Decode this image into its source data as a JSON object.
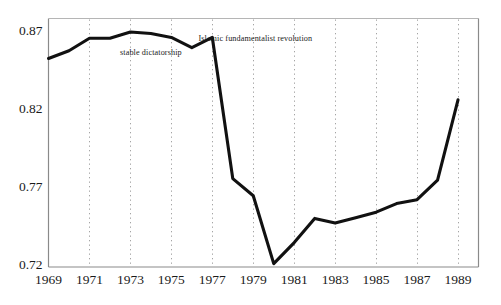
{
  "chart_data": {
    "type": "line",
    "title": "",
    "xlabel": "",
    "ylabel": "",
    "xlim": [
      1969,
      1990
    ],
    "ylim": [
      0.72,
      0.87
    ],
    "grid": "vertical dotted gridlines at odd years",
    "legend": "none",
    "x": [
      1969,
      1970,
      1971,
      1972,
      1973,
      1974,
      1975,
      1976,
      1977,
      1978,
      1979,
      1980,
      1981,
      1982,
      1983,
      1984,
      1985,
      1986,
      1987,
      1988,
      1989
    ],
    "values": [
      0.853,
      0.858,
      0.866,
      0.866,
      0.87,
      0.869,
      0.8665,
      0.86,
      0.8665,
      0.776,
      0.765,
      0.7215,
      0.735,
      0.7505,
      0.7475,
      0.751,
      0.7545,
      0.76,
      0.7625,
      0.775,
      0.8265
    ],
    "series": [
      {
        "name": "index",
        "values": [
          0.853,
          0.858,
          0.866,
          0.866,
          0.87,
          0.869,
          0.8665,
          0.86,
          0.8665,
          0.776,
          0.765,
          0.7215,
          0.735,
          0.7505,
          0.7475,
          0.751,
          0.7545,
          0.76,
          0.7625,
          0.775,
          0.8265
        ]
      }
    ],
    "yticks": [
      0.72,
      0.77,
      0.82,
      0.87
    ],
    "ytick_labels": [
      "0.72",
      "0.77",
      "0.82",
      "0.87"
    ],
    "xticks": [
      1969,
      1971,
      1973,
      1975,
      1977,
      1979,
      1981,
      1983,
      1985,
      1987,
      1989
    ],
    "xtick_labels": [
      "1969",
      "1971",
      "1973",
      "1975",
      "1977",
      "1979",
      "1981",
      "1983",
      "1985",
      "1987",
      "1989"
    ],
    "annotations": [
      {
        "text": "stable dictatorship",
        "x": 1974.0,
        "y": 0.8565
      },
      {
        "text": "Islamic fundamentalist revolution",
        "x": 1979.1,
        "y": 0.8655
      }
    ],
    "colors": {
      "line": "#111111",
      "axis": "#808080",
      "gridline": "#9a9a9a",
      "text": "#1a1a1a",
      "background": "#ffffff"
    }
  }
}
